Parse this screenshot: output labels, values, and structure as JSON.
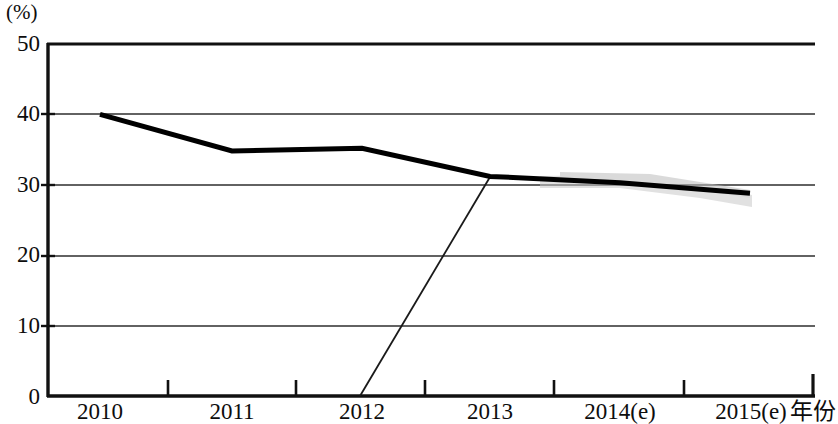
{
  "chart_data": {
    "type": "line",
    "title": "",
    "subtitle": "",
    "xlabel": "年份",
    "ylabel": "(%)",
    "y_unit_label": "(%)",
    "categories": [
      "2010",
      "2011",
      "2012",
      "2013",
      "2014(e)",
      "2015(e)"
    ],
    "x_tick_labels": [
      "2010",
      "2011",
      "2012",
      "2013",
      "2014(e)",
      "2015(e)"
    ],
    "y_tick_labels": [
      "0",
      "10",
      "20",
      "30",
      "40",
      "50"
    ],
    "y_ticks": [
      0,
      10,
      20,
      30,
      40,
      50
    ],
    "ylim": [
      0,
      50
    ],
    "grid": true,
    "grid_axis": "y",
    "legend": false,
    "legend_position": "none",
    "series": [
      {
        "name": "",
        "color": "#000000",
        "line_width": 5,
        "values": [
          40.0,
          34.8,
          35.2,
          31.2,
          30.3,
          28.8
        ]
      }
    ],
    "annotations": [
      {
        "kind": "scan-artifact-line",
        "description": "thin diagonal line from x-axis baseline rising to the 2013 data point",
        "from": {
          "x_category": "2012",
          "value": 0
        },
        "to": {
          "x_category": "2013",
          "value": 31.2
        }
      },
      {
        "kind": "scan-artifact-band",
        "description": "light gray smudge band around the line between 2013 and 2015(e)"
      }
    ]
  },
  "axis": {
    "y_unit": "(%)",
    "x_title": "年份",
    "y_labels": [
      "50",
      "40",
      "30",
      "20",
      "10",
      "0"
    ],
    "x_labels": [
      "2010",
      "2011",
      "2012",
      "2013",
      "2014(e)",
      "2015(e)"
    ]
  },
  "colors": {
    "line": "#000000",
    "axis": "#1a1a1a",
    "grid": "#3a3a3a",
    "band": "#d8d8d8",
    "background": "#ffffff"
  }
}
